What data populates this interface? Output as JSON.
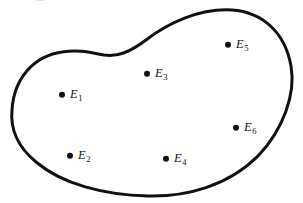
{
  "figure": {
    "type": "set-diagram",
    "background_color": "#ffffff",
    "stroke_color": "#111111",
    "stroke_width": 3,
    "width": 303,
    "height": 203,
    "region": {
      "name": "closed-bean-curve",
      "path": "M 12 110 C 14 78, 34 56, 62 52 C 80 49, 92 53, 104 55 C 118 57, 130 52, 146 40 C 168 23, 200 8, 232 10 C 262 12, 285 32, 291 66 C 296 94, 283 130, 258 156 C 228 186, 186 197, 148 196 C 104 195, 62 184, 36 162 C 18 147, 10 130, 12 110 Z"
    },
    "points": [
      {
        "id": "E1",
        "letter": "E",
        "subscript": "1",
        "label": "E₁",
        "x": 62,
        "y": 95
      },
      {
        "id": "E2",
        "letter": "E",
        "subscript": "2",
        "label": "E₂",
        "x": 70,
        "y": 156
      },
      {
        "id": "E3",
        "letter": "E",
        "subscript": "3",
        "label": "E₃",
        "x": 147,
        "y": 74
      },
      {
        "id": "E4",
        "letter": "E",
        "subscript": "4",
        "label": "E₄",
        "x": 166,
        "y": 159
      },
      {
        "id": "E5",
        "letter": "E",
        "subscript": "5",
        "label": "E₅",
        "x": 228,
        "y": 45
      },
      {
        "id": "E6",
        "letter": "E",
        "subscript": "6",
        "label": "E₆",
        "x": 236,
        "y": 128
      }
    ]
  }
}
